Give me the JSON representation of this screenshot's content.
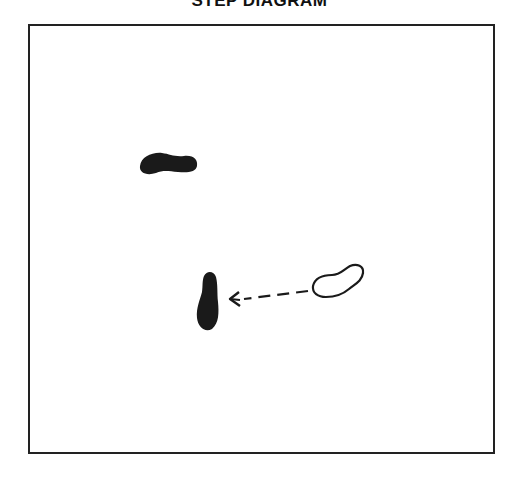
{
  "diagram": {
    "title": "STEP DIAGRAM",
    "footprints": [
      {
        "id": "left-foot-stationary",
        "style": "filled",
        "color": "#1a1a1a"
      },
      {
        "id": "foot-start-position",
        "style": "outline",
        "color": "#1a1a1a"
      },
      {
        "id": "foot-end-position",
        "style": "filled",
        "color": "#1a1a1a"
      }
    ],
    "arrow": {
      "style": "dashed",
      "direction": "left",
      "from": "foot-start-position",
      "to": "foot-end-position"
    }
  }
}
